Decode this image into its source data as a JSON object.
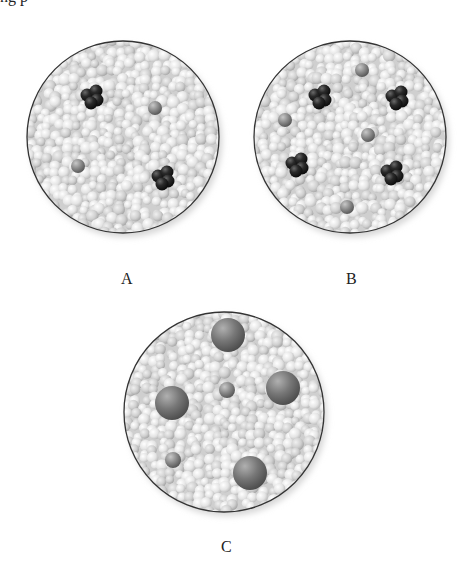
{
  "caption_fragment": "ng p",
  "panels": [
    {
      "label": "A",
      "cx": 123,
      "cy": 137,
      "r": 96,
      "label_pos": {
        "x": 121,
        "y": 270
      },
      "dark_clusters": [
        {
          "x": 92,
          "y": 97
        },
        {
          "x": 163,
          "y": 178
        }
      ],
      "grey_spheres": [
        {
          "x": 155,
          "y": 108,
          "r": 7
        },
        {
          "x": 78,
          "y": 166,
          "r": 7
        }
      ],
      "large_spheres": []
    },
    {
      "label": "B",
      "cx": 350,
      "cy": 137,
      "r": 96,
      "label_pos": {
        "x": 346,
        "y": 270
      },
      "dark_clusters": [
        {
          "x": 320,
          "y": 97
        },
        {
          "x": 397,
          "y": 98
        },
        {
          "x": 297,
          "y": 165
        },
        {
          "x": 392,
          "y": 173
        }
      ],
      "grey_spheres": [
        {
          "x": 362,
          "y": 70,
          "r": 7
        },
        {
          "x": 285,
          "y": 120,
          "r": 7
        },
        {
          "x": 368,
          "y": 135,
          "r": 7
        },
        {
          "x": 347,
          "y": 207,
          "r": 7
        }
      ],
      "large_spheres": []
    },
    {
      "label": "C",
      "cx": 224,
      "cy": 412,
      "r": 100,
      "label_pos": {
        "x": 221,
        "y": 538
      },
      "dark_clusters": [],
      "grey_spheres": [
        {
          "x": 227,
          "y": 390,
          "r": 8
        },
        {
          "x": 173,
          "y": 460,
          "r": 8
        }
      ],
      "large_spheres": [
        {
          "x": 228,
          "y": 335,
          "r": 17
        },
        {
          "x": 172,
          "y": 403,
          "r": 17
        },
        {
          "x": 283,
          "y": 388,
          "r": 17
        },
        {
          "x": 250,
          "y": 473,
          "r": 17
        }
      ]
    }
  ],
  "colors": {
    "background": "#ffffff",
    "circle_outline": "#333333",
    "bead_light": "#f2f2f2",
    "bead_mid": "#c8c8c8",
    "dark_particle": "#1e1e1e",
    "grey_particle": "#8c8c8c"
  }
}
